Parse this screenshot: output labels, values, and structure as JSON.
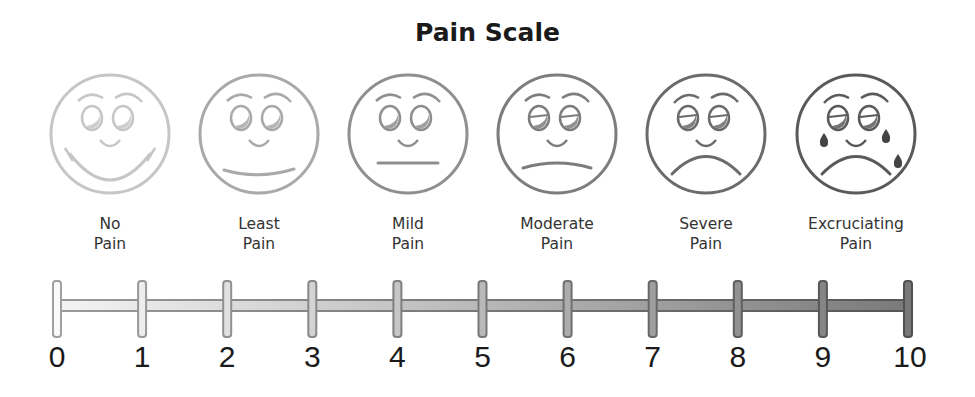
{
  "title": "Pain Scale",
  "faces": [
    {
      "id": "no-pain",
      "line1": "No",
      "line2": "Pain",
      "cx": 110,
      "color": "#c6c6c6",
      "mouth": "big-smile",
      "tears": false
    },
    {
      "id": "least-pain",
      "line1": "Least",
      "line2": "Pain",
      "cx": 259,
      "color": "#a9a9a9",
      "mouth": "slight-smile",
      "tears": false
    },
    {
      "id": "mild-pain",
      "line1": "Mild",
      "line2": "Pain",
      "cx": 408,
      "color": "#8f8f8f",
      "mouth": "flat",
      "tears": false
    },
    {
      "id": "moderate-pain",
      "line1": "Moderate",
      "line2": "Pain",
      "cx": 557,
      "color": "#7d7d7d",
      "mouth": "slight-frown",
      "tears": false
    },
    {
      "id": "severe-pain",
      "line1": "Severe",
      "line2": "Pain",
      "cx": 706,
      "color": "#6b6b6b",
      "mouth": "frown",
      "tears": false
    },
    {
      "id": "excruciating-pain",
      "line1": "Excruciating",
      "line2": "Pain",
      "cx": 856,
      "color": "#5a5a5a",
      "mouth": "frown",
      "tears": true
    }
  ],
  "scale": {
    "min": 0,
    "max": 10,
    "ticks": [
      "0",
      "1",
      "2",
      "3",
      "4",
      "5",
      "6",
      "7",
      "8",
      "9",
      "10"
    ],
    "x_start": 57,
    "x_end": 908,
    "light_color": "#bdbdbd",
    "dark_color": "#707070"
  }
}
